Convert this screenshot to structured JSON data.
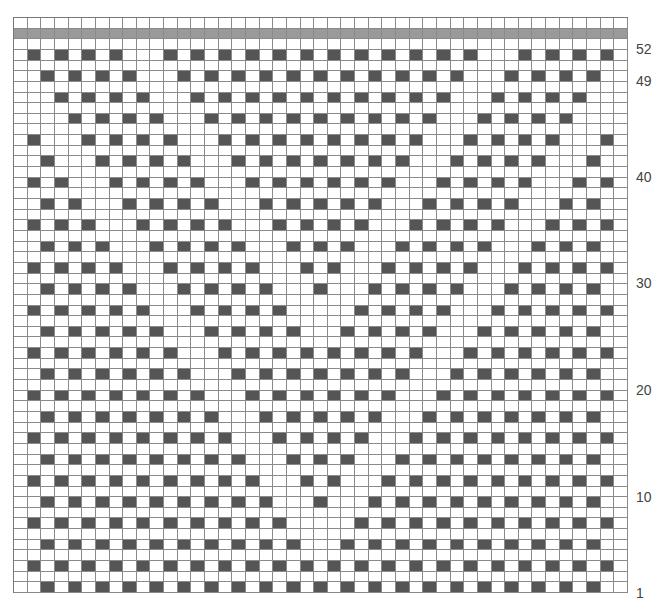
{
  "chart": {
    "columns": 45,
    "total_rows": 54,
    "pattern_rows": 52,
    "band_row": 53,
    "top_blank_row": 54,
    "colors": {
      "filled": "#555555",
      "band": "#9a9a9a",
      "empty": "#ffffff",
      "gridline": "#8a8a8a"
    },
    "row_labels": [
      {
        "row": 52,
        "text": "52"
      },
      {
        "row": 49,
        "text": "49"
      },
      {
        "row": 40,
        "text": "40"
      },
      {
        "row": 30,
        "text": "30"
      },
      {
        "row": 20,
        "text": "20"
      },
      {
        "row": 10,
        "text": "10"
      },
      {
        "row": 1,
        "text": "1"
      }
    ],
    "filled_cells": {
      "51": {
        "parity": "even",
        "from": 2,
        "to": 44,
        "except": [
          10,
          36
        ]
      },
      "49": {
        "parity": "odd",
        "from": 3,
        "to": 43,
        "except": [
          11,
          35
        ]
      },
      "47": {
        "parity": "even",
        "from": 4,
        "to": 42,
        "except": [
          12,
          34
        ]
      },
      "45": {
        "parity": "odd",
        "from": 5,
        "to": 41,
        "except": [
          13,
          33
        ]
      },
      "43": {
        "parity": "even",
        "from": 2,
        "to": 44,
        "except": [
          4,
          14,
          32,
          42
        ]
      },
      "41": {
        "parity": "odd",
        "from": 3,
        "to": 43,
        "except": [
          5,
          15,
          31,
          41
        ]
      },
      "39": {
        "parity": "even",
        "from": 2,
        "to": 44,
        "except": [
          6,
          16,
          30,
          40
        ]
      },
      "37": {
        "parity": "odd",
        "from": 3,
        "to": 43,
        "except": [
          7,
          17,
          29,
          39
        ]
      },
      "35": {
        "parity": "even",
        "from": 2,
        "to": 44,
        "except": [
          8,
          18,
          28,
          38
        ]
      },
      "33": {
        "parity": "odd",
        "from": 3,
        "to": 43,
        "except": [
          9,
          19,
          27,
          37
        ]
      },
      "31": {
        "parity": "even",
        "from": 2,
        "to": 44,
        "except": [
          10,
          20,
          26,
          36
        ]
      },
      "29": {
        "parity": "odd",
        "from": 3,
        "to": 43,
        "except": [
          11,
          21,
          25,
          35
        ]
      },
      "27": {
        "parity": "even",
        "from": 2,
        "to": 44,
        "except": [
          12,
          22,
          24,
          34
        ]
      },
      "25": {
        "parity": "odd",
        "from": 3,
        "to": 43,
        "except": [
          13,
          23,
          33
        ]
      },
      "23": {
        "parity": "even",
        "from": 2,
        "to": 44,
        "except": [
          14,
          32
        ]
      },
      "21": {
        "parity": "odd",
        "from": 3,
        "to": 43,
        "except": [
          15,
          31
        ]
      },
      "19": {
        "parity": "even",
        "from": 2,
        "to": 44,
        "except": [
          16,
          30
        ]
      },
      "17": {
        "parity": "odd",
        "from": 3,
        "to": 43,
        "except": [
          17,
          29
        ]
      },
      "15": {
        "parity": "even",
        "from": 2,
        "to": 44,
        "except": [
          18,
          28
        ]
      },
      "13": {
        "parity": "odd",
        "from": 3,
        "to": 43,
        "except": [
          19,
          27
        ]
      },
      "11": {
        "parity": "even",
        "from": 2,
        "to": 44,
        "except": [
          20,
          26
        ]
      },
      "9": {
        "parity": "odd",
        "from": 3,
        "to": 43,
        "except": [
          21,
          25
        ]
      },
      "7": {
        "parity": "even",
        "from": 2,
        "to": 44,
        "except": [
          22,
          24
        ]
      },
      "5": {
        "parity": "odd",
        "from": 3,
        "to": 43,
        "except": [
          23
        ]
      },
      "3": {
        "parity": "even",
        "from": 2,
        "to": 44,
        "except": []
      },
      "1": {
        "parity": "odd",
        "from": 3,
        "to": 43,
        "except": []
      }
    }
  }
}
